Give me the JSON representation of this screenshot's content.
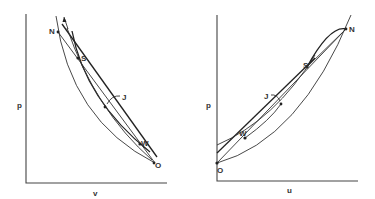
{
  "figure": {
    "panels": [
      {
        "id": "left",
        "plane": "p-v",
        "x_label": "v",
        "y_label": "p",
        "points": [
          {
            "label": "N"
          },
          {
            "label": "S"
          },
          {
            "label": "J"
          },
          {
            "label": "W"
          },
          {
            "label": "O"
          }
        ]
      },
      {
        "id": "right",
        "plane": "p-u",
        "x_label": "u",
        "y_label": "p",
        "points": [
          {
            "label": "N"
          },
          {
            "label": "S"
          },
          {
            "label": "J"
          },
          {
            "label": "W"
          },
          {
            "label": "O"
          }
        ]
      }
    ],
    "colors": {
      "background": "#ffffff",
      "ink": "#333333"
    }
  }
}
